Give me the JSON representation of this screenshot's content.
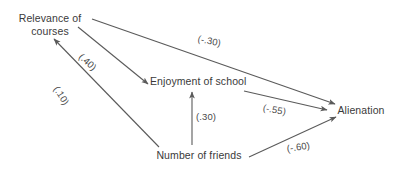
{
  "diagram": {
    "type": "path-diagram",
    "background_color": "#ffffff",
    "line_color": "#5a5a5a",
    "text_color": "#3a3a3a",
    "nodes": [
      {
        "id": "relevance",
        "label": "Relevance of\ncourses"
      },
      {
        "id": "enjoyment",
        "label": "Enjoyment of school"
      },
      {
        "id": "alienation",
        "label": "Alienation"
      },
      {
        "id": "friends",
        "label": "Number of friends"
      }
    ],
    "paths": [
      {
        "from": "relevance",
        "to": "alienation",
        "coefficient": "(-.30)"
      },
      {
        "from": "relevance",
        "to": "enjoyment",
        "coefficient": "(.40)"
      },
      {
        "from": "friends",
        "to": "relevance",
        "coefficient": "(.10)"
      },
      {
        "from": "friends",
        "to": "enjoyment",
        "coefficient": "(.30)"
      },
      {
        "from": "enjoyment",
        "to": "alienation",
        "coefficient": "(-.55)"
      },
      {
        "from": "friends",
        "to": "alienation",
        "coefficient": "(-.60)"
      }
    ]
  }
}
